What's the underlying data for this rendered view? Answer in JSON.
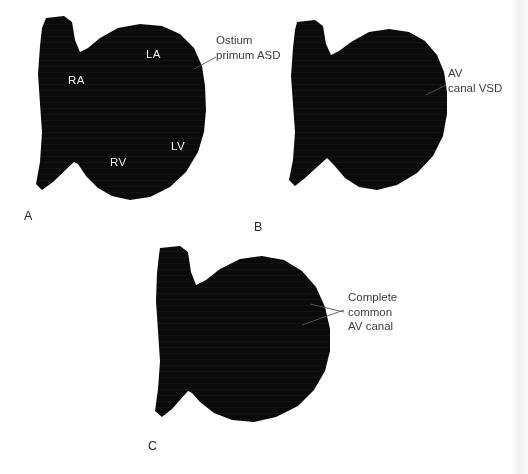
{
  "figure": {
    "background_color": "#ffffff",
    "silhouette_color": "#0a0a0a",
    "label_text_color": "#3b3b3b",
    "chamber_text_color": "#f2f2f2",
    "leader_line_color": "#555555",
    "width": 528,
    "height": 474
  },
  "panels": [
    {
      "letter": "A",
      "chambers": [
        {
          "name": "right-atrium",
          "label": "RA"
        },
        {
          "name": "left-atrium",
          "label": "LA"
        },
        {
          "name": "right-ventricle",
          "label": "RV"
        },
        {
          "name": "left-ventricle",
          "label": "LV"
        }
      ],
      "callout": {
        "name": "ostium-primum-asd",
        "lines": [
          "Ostium",
          "primum ASD"
        ]
      }
    },
    {
      "letter": "B",
      "chambers": [],
      "callout": {
        "name": "av-canal-vsd",
        "lines": [
          "AV",
          "canal VSD"
        ]
      }
    },
    {
      "letter": "C",
      "chambers": [],
      "callout": {
        "name": "complete-common-av-canal",
        "lines": [
          "Complete",
          "common",
          "AV canal"
        ]
      }
    }
  ]
}
